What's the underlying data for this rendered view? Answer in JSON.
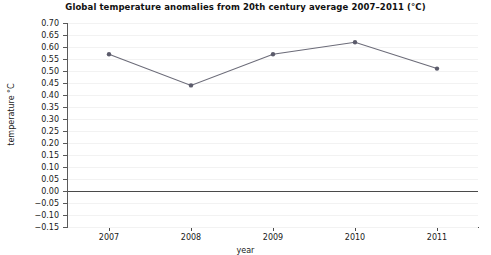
{
  "chart_data": {
    "type": "line",
    "title": "Global  temperature anomalies from 20th century average 2007–2011 (°C)",
    "xlabel": "year",
    "ylabel": "temperature °C",
    "categories": [
      "2007",
      "2008",
      "2009",
      "2010",
      "2011"
    ],
    "values": [
      0.57,
      0.44,
      0.57,
      0.62,
      0.51
    ],
    "series": [
      {
        "name": "Global temperature anomaly",
        "values": [
          0.57,
          0.44,
          0.57,
          0.62,
          0.51
        ]
      }
    ],
    "ylim": [
      -0.15,
      0.7
    ],
    "ytick_step": 0.05,
    "yticks": [
      "0.70",
      "0.65",
      "0.60",
      "0.55",
      "0.50",
      "0.45",
      "0.40",
      "0.35",
      "0.30",
      "0.25",
      "0.20",
      "0.15",
      "0.10",
      "0.05",
      "0.00",
      "−0.05",
      "−0.10",
      "−0.15"
    ],
    "ytick_values": [
      0.7,
      0.65,
      0.6,
      0.55,
      0.5,
      0.45,
      0.4,
      0.35,
      0.3,
      0.25,
      0.2,
      0.15,
      0.1,
      0.05,
      0.0,
      -0.05,
      -0.1,
      -0.15
    ],
    "grid": true,
    "legend": "none",
    "line_color": "#6b6b78",
    "marker_color": "#5b5b6b",
    "zero_line_color": "#4a4a4a",
    "background": "#ffffff"
  }
}
